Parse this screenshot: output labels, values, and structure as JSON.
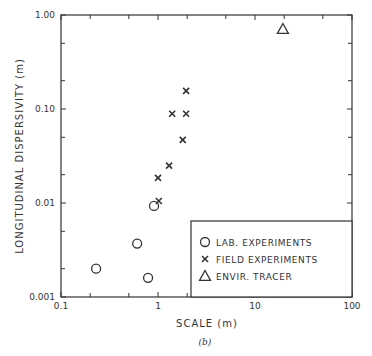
{
  "chart_data": {
    "type": "scatter",
    "title": "",
    "caption": "(b)",
    "xlabel": "SCALE (m)",
    "ylabel": "LONGITUDINAL DISPERSIVITY (m)",
    "xscale": "log",
    "yscale": "log",
    "xlim": [
      0.1,
      100
    ],
    "ylim": [
      0.001,
      1.0
    ],
    "x_tick_labels": [
      "0.1",
      "1",
      "10",
      "100"
    ],
    "y_tick_labels": [
      "0.001",
      "0.01",
      "0.10",
      "1.00"
    ],
    "grid": false,
    "legend_position": "lower right",
    "series": [
      {
        "name": "LAB. EXPERIMENTS",
        "marker": "circle",
        "points": [
          {
            "x": 0.23,
            "y": 0.002
          },
          {
            "x": 0.61,
            "y": 0.0037
          },
          {
            "x": 0.79,
            "y": 0.0016
          },
          {
            "x": 0.91,
            "y": 0.0093
          }
        ]
      },
      {
        "name": "FIELD EXPERIMENTS",
        "marker": "x",
        "points": [
          {
            "x": 1.02,
            "y": 0.0105
          },
          {
            "x": 1.0,
            "y": 0.0185
          },
          {
            "x": 1.3,
            "y": 0.025
          },
          {
            "x": 1.8,
            "y": 0.047
          },
          {
            "x": 1.4,
            "y": 0.089
          },
          {
            "x": 1.95,
            "y": 0.089
          },
          {
            "x": 1.95,
            "y": 0.156
          }
        ]
      },
      {
        "name": "ENVIR. TRACER",
        "marker": "triangle",
        "points": [
          {
            "x": 19.4,
            "y": 0.71
          }
        ]
      }
    ]
  }
}
